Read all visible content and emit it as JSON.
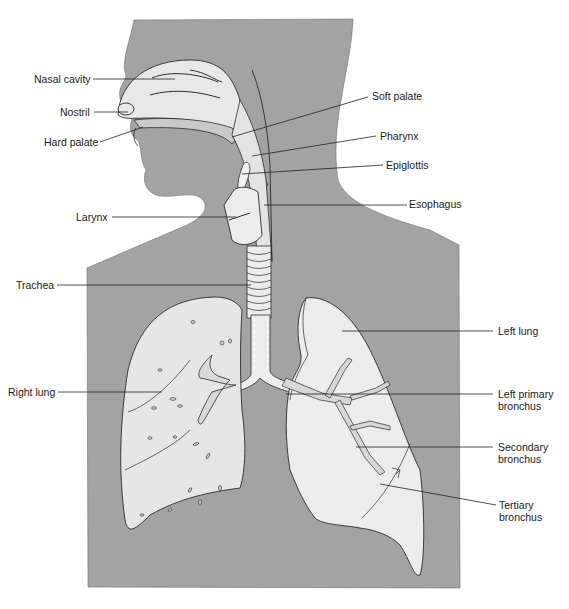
{
  "figure": {
    "colors": {
      "background": "#ffffff",
      "body_silhouette": "#a3a3a3",
      "organ_fill": "#e6e6e6",
      "organ_highlight": "#f2f2f2",
      "outline": "#2b2b2b",
      "leader_line": "#222222",
      "label_text": "#1a1a1a"
    }
  },
  "labels": {
    "nasal_cavity": "Nasal cavity",
    "nostril": "Nostril",
    "hard_palate": "Hard palate",
    "soft_palate": "Soft palate",
    "pharynx": "Pharynx",
    "epiglottis": "Epiglottis",
    "larynx": "Larynx",
    "esophagus": "Esophagus",
    "trachea": "Trachea",
    "left_lung": "Left lung",
    "right_lung": "Right lung",
    "left_primary_bronchus": "Left primary bronchus",
    "secondary_bronchus": "Secondary bronchus",
    "tertiary_bronchus": "Tertiary bronchus"
  }
}
